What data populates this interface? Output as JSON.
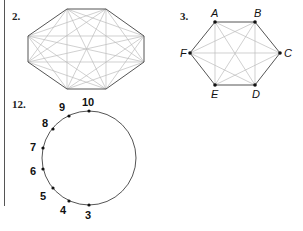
{
  "problems": [
    {
      "number": "2.",
      "figure": "octagon-with-all-diagonals"
    },
    {
      "number": "3.",
      "figure": "hexagon-with-all-diagonals",
      "vertex_labels": [
        "A",
        "B",
        "C",
        "D",
        "E",
        "F"
      ]
    },
    {
      "number": "12.",
      "figure": "circle-with-points",
      "point_labels": [
        "10",
        "9",
        "8",
        "7",
        "6",
        "5",
        "4",
        "3"
      ]
    }
  ],
  "colors": {
    "edge": "#555555",
    "diagonal": "#bbbbbb",
    "point": "#111111"
  }
}
